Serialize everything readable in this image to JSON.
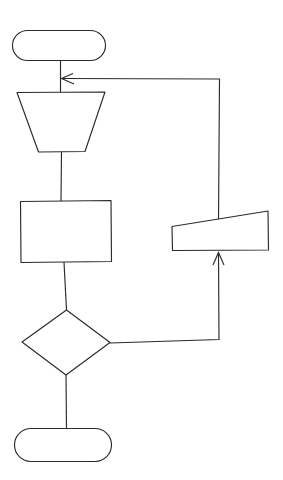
{
  "diagram": {
    "type": "flowchart",
    "background_color": "#ffffff",
    "stroke_color": "#2b2b2b",
    "fill_color": "#ffffff",
    "canvas": {
      "width": 283,
      "height": 480
    },
    "nodes": [
      {
        "id": "start-terminal",
        "shape": "stadium",
        "role": "terminator",
        "label": "",
        "x": 12,
        "y": 30,
        "width": 94,
        "height": 31
      },
      {
        "id": "merge-trapezoid",
        "shape": "inverted-trapezoid",
        "role": "merge",
        "label": "",
        "x": 17,
        "y": 92,
        "width": 88,
        "height": 60,
        "bottom_width": 47
      },
      {
        "id": "process-rectangle",
        "shape": "rectangle",
        "role": "process",
        "label": "",
        "x": 20,
        "y": 201,
        "width": 91,
        "height": 61
      },
      {
        "id": "decision-diamond",
        "shape": "diamond",
        "role": "decision",
        "label": "",
        "x": 22,
        "y": 310,
        "width": 88,
        "height": 65
      },
      {
        "id": "end-terminal",
        "shape": "stadium",
        "role": "terminator",
        "label": "",
        "x": 14,
        "y": 428,
        "width": 98,
        "height": 34
      },
      {
        "id": "data-parallelogram",
        "shape": "slanted-quadrilateral",
        "role": "data",
        "label": "",
        "x": 172,
        "y": 211,
        "width": 96,
        "height": 39,
        "top_left_y": 226,
        "top_right_y": 211
      }
    ],
    "connectors": [
      {
        "id": "start-to-merge",
        "from": "start-terminal",
        "to": "merge-trapezoid",
        "label": "",
        "arrow": false,
        "points": "61,61 61,92"
      },
      {
        "id": "merge-to-process",
        "from": "merge-trapezoid",
        "to": "process-rectangle",
        "label": "",
        "arrow": false,
        "points": "61,152 61,201"
      },
      {
        "id": "process-to-decision",
        "from": "process-rectangle",
        "to": "decision-diamond",
        "label": "",
        "arrow": false,
        "points": "64,262 66,310"
      },
      {
        "id": "decision-to-end",
        "from": "decision-diamond",
        "to": "end-terminal",
        "label": "",
        "arrow": false,
        "points": "66,375 66,428"
      },
      {
        "id": "decision-to-data",
        "from": "decision-diamond",
        "to": "data-parallelogram",
        "label": "",
        "arrow": true,
        "arrow_direction": "up",
        "points": "110,343 219,339 219,253"
      },
      {
        "id": "data-to-merge-loop",
        "from": "data-parallelogram",
        "to": "merge-trapezoid",
        "label": "",
        "arrow": true,
        "arrow_direction": "left",
        "points": "218,222 218,78 62,78"
      }
    ]
  }
}
